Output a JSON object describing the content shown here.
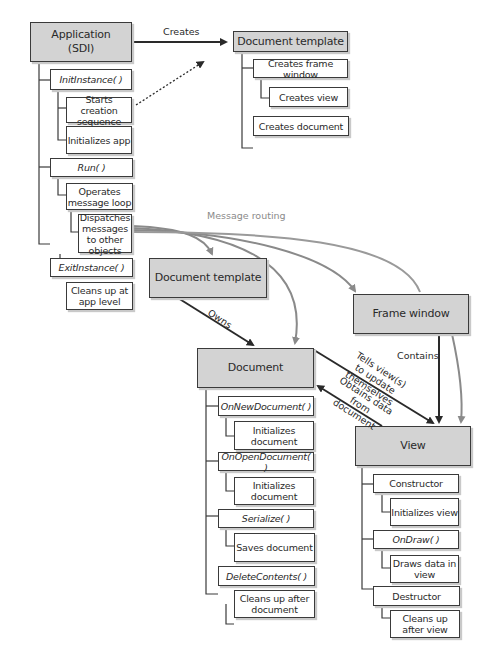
{
  "application": {
    "title": "Application\n(SDI)",
    "methods": [
      {
        "name": "InitInstance( )",
        "steps": [
          "Starts creation sequence",
          "Initializes app"
        ]
      },
      {
        "name": "Run( )",
        "steps": [
          "Operates message loop",
          "Dispatches messages to other objects"
        ]
      },
      {
        "name": "ExitInstance( )",
        "steps": [
          "Cleans up at app level"
        ]
      }
    ]
  },
  "doc_template_top": {
    "title": "Document template",
    "steps": [
      "Creates frame window",
      "Creates view",
      "Creates document"
    ]
  },
  "doc_template": {
    "title": "Document template"
  },
  "frame_window": {
    "title": "Frame window"
  },
  "document": {
    "title": "Document",
    "methods": [
      {
        "name": "OnNewDocument( )",
        "steps": [
          "Initializes document"
        ]
      },
      {
        "name": "OnOpenDocument( )",
        "steps": [
          "Initializes document"
        ]
      },
      {
        "name": "Serialize( )",
        "steps": [
          "Saves document"
        ]
      },
      {
        "name": "DeleteContents( )",
        "steps": [
          "Cleans up after document"
        ]
      }
    ]
  },
  "view": {
    "title": "View",
    "methods": [
      {
        "name": "Constructor",
        "italic": false,
        "steps": [
          "Initializes view"
        ]
      },
      {
        "name": "OnDraw( )",
        "italic": true,
        "steps": [
          "Draws data in view"
        ]
      },
      {
        "name": "Destructor",
        "italic": false,
        "steps": [
          "Cleans up after view"
        ]
      }
    ]
  },
  "labels": {
    "creates": "Creates",
    "message_routing": "Message routing",
    "owns": "Owns",
    "contains": "Contains",
    "tells_views": "Tells view(s) to update themselves",
    "obtains_data": "Obtains data from document"
  },
  "colors": {
    "main_fill": "#d3d3d3",
    "border": "#3a3a3a",
    "routing_arrow": "#8a8a8a",
    "solid_arrow": "#2a2a2a"
  }
}
